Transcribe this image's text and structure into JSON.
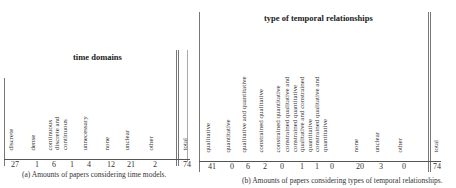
{
  "table_a": {
    "title": "time domains",
    "headers": [
      "discrete",
      "dense",
      "continuous",
      "discrete and|continuous",
      "unnecessary",
      "none",
      "unclear",
      "other"
    ],
    "values": [
      "27",
      "1",
      "6",
      "1",
      "4",
      "12",
      "21",
      "2"
    ],
    "total_label": "total",
    "total_value": "74",
    "caption": "(a) Amounts of papers considering time models."
  },
  "table_b": {
    "title": "type of temporal relationships",
    "headers": [
      "qualitative",
      "quantitative",
      "qualitative and quantitative",
      "constrained qualitative",
      "constrained quantitative",
      "constrained qualitative and|constrained quantitative",
      "qualitative and constrained|quantitative",
      "constrained qualitative and|quantitative",
      "none",
      "unclear",
      "other"
    ],
    "values": [
      "41",
      "0",
      "6",
      "2",
      "0",
      "1",
      "1",
      "0",
      "20",
      "3",
      "0"
    ],
    "total_label": "total",
    "total_value": "74",
    "caption": "(b) Amounts of papers considering types of temporal relationships."
  }
}
